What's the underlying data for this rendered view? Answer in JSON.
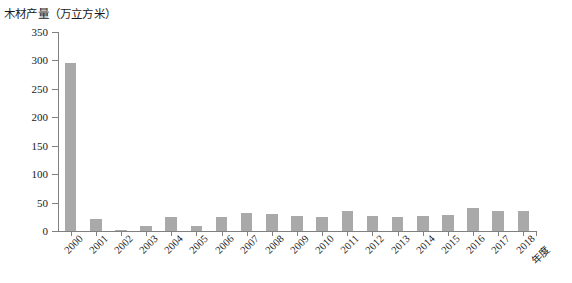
{
  "chart_data": {
    "type": "bar",
    "title": "木材产量（万立方米）",
    "xlabel": "年度",
    "ylabel": "",
    "ylim": [
      0,
      350
    ],
    "yticks": [
      0,
      50,
      100,
      150,
      200,
      250,
      300,
      350
    ],
    "grid": false,
    "legend": null,
    "bar_color": "#a9a9a9",
    "categories": [
      "2000",
      "2001",
      "2002",
      "2003",
      "2004",
      "2005",
      "2006",
      "2007",
      "2008",
      "2009",
      "2010",
      "2011",
      "2012",
      "2013",
      "2014",
      "2015",
      "2016",
      "2017",
      "2018"
    ],
    "values": [
      296,
      21,
      2,
      8,
      25,
      8,
      24,
      31,
      30,
      27,
      24,
      35,
      27,
      25,
      27,
      29,
      40,
      35,
      35
    ]
  },
  "axes": {
    "y_tick_labels": [
      "350",
      "300",
      "250",
      "200",
      "150",
      "100",
      "50",
      "0"
    ],
    "x_tick_labels": [
      "2000",
      "2001",
      "2002",
      "2003",
      "2004",
      "2005",
      "2006",
      "2007",
      "2008",
      "2009",
      "2010",
      "2011",
      "2012",
      "2013",
      "2014",
      "2015",
      "2016",
      "2017",
      "2018"
    ],
    "x_axis_title": "年度"
  }
}
